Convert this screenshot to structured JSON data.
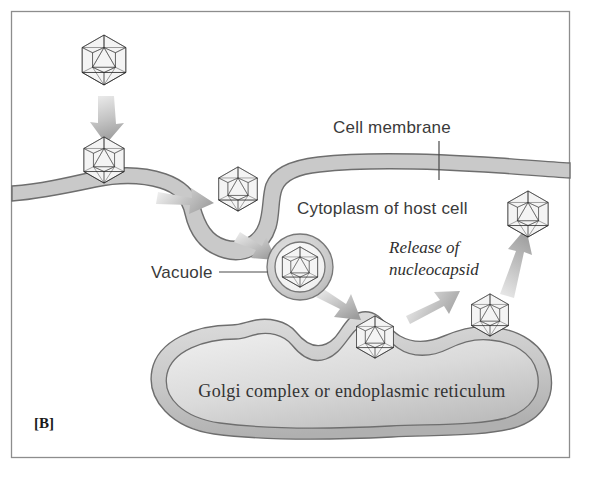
{
  "figure": {
    "panel_label": "[B]",
    "title_implicit": "Virus entry by endocytosis and release of nucleocapsid",
    "labels": {
      "cell_membrane": "Cell membrane",
      "cytoplasm": "Cytoplasm of host cell",
      "vacuole": "Vacuole",
      "release": "Release of",
      "nucleocapsid": "nucleocapsid",
      "golgi": "Golgi complex or endoplasmic reticulum"
    },
    "colors": {
      "background": "#ffffff",
      "frame": "#8d8d8d",
      "membrane_fill": "#c9c9c9",
      "membrane_stroke": "#6e6e6e",
      "organelle_fill_light": "#e3e3e3",
      "organelle_fill_mid": "#c4c4c4",
      "capsid_stroke": "#1b1b1b",
      "capsid_light": "#f2f2f2",
      "capsid_mid": "#b9b9b9",
      "capsid_dark": "#4a4a4a",
      "arrow_fill": "#b3b3b3",
      "text": "#3a3a3a"
    },
    "virus_particles": [
      {
        "name": "virion-extracellular-top",
        "x": 104,
        "y": 60,
        "r": 26,
        "state": "free outside cell"
      },
      {
        "name": "virion-attaching-membrane",
        "x": 104,
        "y": 160,
        "r": 24,
        "state": "attached to membrane"
      },
      {
        "name": "virion-in-invagination",
        "x": 238,
        "y": 189,
        "r": 23,
        "state": "engulfed in membrane pit"
      },
      {
        "name": "virion-in-vacuole",
        "x": 300,
        "y": 267,
        "r": 21,
        "state": "inside vacuole"
      },
      {
        "name": "virion-at-golgi",
        "x": 375,
        "y": 337,
        "r": 22,
        "state": "in golgi invagination"
      },
      {
        "name": "virion-budding-golgi",
        "x": 490,
        "y": 315,
        "r": 22,
        "state": "released from golgi"
      },
      {
        "name": "virion-released-nucleocapsid",
        "x": 528,
        "y": 214,
        "r": 24,
        "state": "free nucleocapsid"
      }
    ],
    "arrows": [
      {
        "name": "arrow-virion-descends",
        "from": [
          106,
          98
        ],
        "to": [
          104,
          138
        ]
      },
      {
        "name": "arrow-into-invagination",
        "from": [
          162,
          200
        ],
        "to": [
          208,
          202
        ]
      },
      {
        "name": "arrow-to-vacuole",
        "from": [
          246,
          236
        ],
        "to": [
          277,
          253
        ]
      },
      {
        "name": "arrow-vacuole-to-golgi",
        "from": [
          325,
          290
        ],
        "to": [
          362,
          315
        ]
      },
      {
        "name": "arrow-golgi-to-bud",
        "from": [
          408,
          313
        ],
        "to": [
          452,
          295
        ]
      },
      {
        "name": "arrow-bud-to-release",
        "from": [
          508,
          288
        ],
        "to": [
          522,
          240
        ]
      }
    ]
  }
}
